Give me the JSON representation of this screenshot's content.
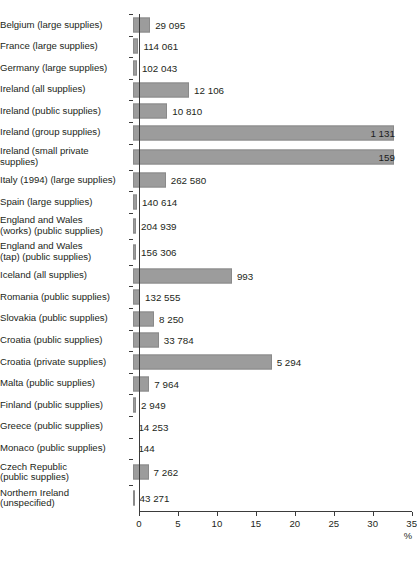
{
  "chart_data": {
    "type": "bar",
    "orientation": "horizontal",
    "title": "",
    "xlabel": "%",
    "ylabel": "",
    "xlim": [
      0,
      35
    ],
    "xticks": [
      0,
      5,
      10,
      15,
      20,
      25,
      30,
      35
    ],
    "xtick_labels": [
      "0",
      "5",
      "10",
      "15",
      "20",
      "25",
      "30",
      "35"
    ],
    "grid": false,
    "legend": "none",
    "bar_color": "#9c9c9c",
    "axis_color": "#3b3b3b",
    "value_label_note": "Number printed at the end of each bar is the population (or sample) count for that supply category.",
    "categories": [
      "Belgium (large supplies)",
      "France (large supplies)",
      "Germany (large supplies)",
      "Ireland (all supplies)",
      "Ireland (public supplies)",
      "Ireland (group supplies)",
      "Ireland (small private supplies)",
      "Italy (1994) (large supplies)",
      "Spain (large supplies)",
      "England and Wales (works) (public supplies)",
      "England and Wales (tap) (public supplies)",
      "Iceland (all supplies)",
      "Romania (public supplies)",
      "Slovakia (public supplies)",
      "Croatia (public supplies)",
      "Croatia (private supplies)",
      "Malta (public supplies)",
      "Finland (public supplies)",
      "Greece (public supplies)",
      "Monaco (public supplies)",
      "Czech Republic (public supplies)",
      "Northern Ireland (unspecified)"
    ],
    "values": [
      2.2,
      0.7,
      0.5,
      7.2,
      4.4,
      33.5,
      33.5,
      4.2,
      0.5,
      0.4,
      0.4,
      12.7,
      0.9,
      2.7,
      3.3,
      17.8,
      2.1,
      0.4,
      0.05,
      0.05,
      2.0,
      0.2
    ],
    "counts": [
      "29 095",
      "114 061",
      "102 043",
      "12 106",
      "10 810",
      "1 131",
      "159",
      "262 580",
      "140 614",
      "204 939",
      "156 306",
      "993",
      "132 555",
      "8 250",
      "33 784",
      "5 294",
      "7 964",
      "2 949",
      "14 253",
      "144",
      "7 262",
      "43 271"
    ]
  },
  "rows": [
    {
      "label_lines": [
        "Belgium (large supplies)"
      ],
      "value": 2.2,
      "count": "29 095",
      "label_inside": false
    },
    {
      "label_lines": [
        "France (large supplies)"
      ],
      "value": 0.7,
      "count": "114 061",
      "label_inside": false
    },
    {
      "label_lines": [
        "Germany (large supplies)"
      ],
      "value": 0.5,
      "count": "102 043",
      "label_inside": false
    },
    {
      "label_lines": [
        "Ireland (all supplies)"
      ],
      "value": 7.2,
      "count": "12 106",
      "label_inside": false
    },
    {
      "label_lines": [
        "Ireland (public supplies)"
      ],
      "value": 4.4,
      "count": "10 810",
      "label_inside": false
    },
    {
      "label_lines": [
        "Ireland (group supplies)"
      ],
      "value": 33.5,
      "count": "1 131",
      "label_inside": true
    },
    {
      "label_lines": [
        "Ireland (small private",
        "supplies)"
      ],
      "value": 33.5,
      "count": "159",
      "label_inside": true
    },
    {
      "label_lines": [
        "Italy (1994) (large supplies)"
      ],
      "value": 4.2,
      "count": "262 580",
      "label_inside": false
    },
    {
      "label_lines": [
        "Spain (large supplies)"
      ],
      "value": 0.5,
      "count": "140 614",
      "label_inside": false
    },
    {
      "label_lines": [
        "England and Wales",
        "(works) (public supplies)"
      ],
      "value": 0.4,
      "count": "204 939",
      "label_inside": false
    },
    {
      "label_lines": [
        "England and Wales",
        "(tap) (public supplies)"
      ],
      "value": 0.4,
      "count": "156 306",
      "label_inside": false
    },
    {
      "label_lines": [
        "Iceland (all supplies)"
      ],
      "value": 12.7,
      "count": "993",
      "label_inside": false
    },
    {
      "label_lines": [
        "Romania (public supplies)"
      ],
      "value": 0.9,
      "count": "132 555",
      "label_inside": false
    },
    {
      "label_lines": [
        "Slovakia (public supplies)"
      ],
      "value": 2.7,
      "count": "8 250",
      "label_inside": false
    },
    {
      "label_lines": [
        "Croatia (public supplies)"
      ],
      "value": 3.3,
      "count": "33 784",
      "label_inside": false
    },
    {
      "label_lines": [
        "Croatia (private supplies)"
      ],
      "value": 17.8,
      "count": "5 294",
      "label_inside": false
    },
    {
      "label_lines": [
        "Malta (public supplies)"
      ],
      "value": 2.1,
      "count": "7 964",
      "label_inside": false
    },
    {
      "label_lines": [
        "Finland (public supplies)"
      ],
      "value": 0.4,
      "count": "2 949",
      "label_inside": false
    },
    {
      "label_lines": [
        "Greece (public supplies)"
      ],
      "value": 0.05,
      "count": "14 253",
      "label_inside": false
    },
    {
      "label_lines": [
        "Monaco (public supplies)"
      ],
      "value": 0.05,
      "count": "144",
      "label_inside": false
    },
    {
      "label_lines": [
        "Czech Republic",
        "(public supplies)"
      ],
      "value": 2.0,
      "count": "7 262",
      "label_inside": false
    },
    {
      "label_lines": [
        "Northern Ireland",
        "(unspecified)"
      ],
      "value": 0.2,
      "count": "43 271",
      "label_inside": false
    }
  ],
  "axis": {
    "ticks": [
      "0",
      "5",
      "10",
      "15",
      "20",
      "25",
      "30",
      "35"
    ],
    "unit": "%"
  }
}
